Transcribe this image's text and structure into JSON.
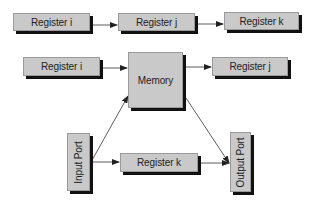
{
  "diagram": {
    "top_row": {
      "boxes": [
        {
          "label": "Register i"
        },
        {
          "label": "Register j"
        },
        {
          "label": "Register k"
        }
      ]
    },
    "middle_row": {
      "left": {
        "label": "Register i"
      },
      "center": {
        "label": "Memory"
      },
      "right": {
        "label": "Register j"
      }
    },
    "bottom_row": {
      "input": {
        "label": "Input Port"
      },
      "register": {
        "label": "Register k"
      },
      "output": {
        "label": "Output Port"
      }
    },
    "colors": {
      "box_fill": "#c9c9c9",
      "box_shadow": "#111111",
      "line": "#222222",
      "text": "#222222"
    },
    "connections": [
      {
        "from": "Register i (top)",
        "to": "Register j (top)"
      },
      {
        "from": "Register j (top)",
        "to": "Register k (top)"
      },
      {
        "from": "Register i (middle)",
        "to": "Memory"
      },
      {
        "from": "Memory",
        "to": "Register j (middle)"
      },
      {
        "from": "Input Port",
        "to": "Memory"
      },
      {
        "from": "Input Port",
        "to": "Register k (bottom)"
      },
      {
        "from": "Register k (bottom)",
        "to": "Output Port"
      },
      {
        "from": "Memory",
        "to": "Output Port"
      }
    ]
  }
}
